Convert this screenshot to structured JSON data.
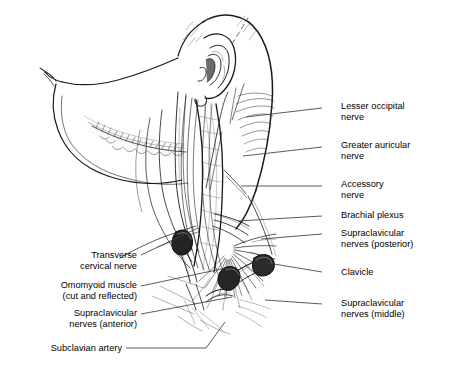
{
  "figure": {
    "background_color": "#ffffff",
    "ink_color": "#1a1a1a",
    "leader_color": "#3d3d3d",
    "labels_right": [
      {
        "id": "lesser-occipital-nerve",
        "lines": [
          "Lesser occipital",
          "nerve"
        ],
        "text_x": 341,
        "text_y": 101,
        "leader": {
          "x1": 322,
          "y1": 108,
          "x2": 246,
          "y2": 117
        }
      },
      {
        "id": "greater-auricular-nerve",
        "lines": [
          "Greater auricular",
          "nerve"
        ],
        "text_x": 341,
        "text_y": 140,
        "leader": {
          "x1": 322,
          "y1": 147,
          "x2": 243,
          "y2": 156
        }
      },
      {
        "id": "accessory-nerve",
        "lines": [
          "Accessory",
          "nerve"
        ],
        "text_x": 341,
        "text_y": 179,
        "leader": {
          "x1": 322,
          "y1": 186,
          "x2": 241,
          "y2": 186
        }
      },
      {
        "id": "brachial-plexus",
        "lines": [
          "Brachial plexus"
        ],
        "text_x": 341,
        "text_y": 212,
        "leader": {
          "x1": 322,
          "y1": 216,
          "x2": 238,
          "y2": 221
        }
      },
      {
        "id": "supraclavicular-nerves-posterior",
        "lines": [
          "Supraclavicular",
          "nerves (posterior)"
        ],
        "text_x": 341,
        "text_y": 229,
        "leader": {
          "x1": 322,
          "y1": 234,
          "x2": 261,
          "y2": 239
        }
      },
      {
        "id": "clavicle",
        "lines": [
          "Clavicle"
        ],
        "text_x": 341,
        "text_y": 270,
        "leader": {
          "x1": 322,
          "y1": 272,
          "x2": 268,
          "y2": 263
        }
      },
      {
        "id": "supraclavicular-nerves-middle",
        "lines": [
          "Supraclavicular",
          "nerves (middle)"
        ],
        "text_x": 341,
        "text_y": 299,
        "leader": {
          "x1": 322,
          "y1": 304,
          "x2": 265,
          "y2": 300
        }
      }
    ],
    "labels_left": [
      {
        "id": "transverse-cervical-nerve",
        "lines": [
          "Transverse",
          "cervical nerve"
        ],
        "text_right_x": 137,
        "text_y": 255,
        "leader": {
          "x1": 141,
          "y1": 255,
          "x2": 198,
          "y2": 228
        }
      },
      {
        "id": "omohyoid-muscle",
        "lines": [
          "Omomyoid muscle",
          "(cut and reflected)"
        ],
        "text_right_x": 137,
        "text_y": 283,
        "leader": {
          "x1": 141,
          "y1": 286,
          "x2": 226,
          "y2": 268
        }
      },
      {
        "id": "supraclavicular-nerves-anterior",
        "lines": [
          "Supraclavicular",
          "nerves (anterior)"
        ],
        "text_right_x": 137,
        "text_y": 311,
        "leader": {
          "x1": 141,
          "y1": 314,
          "x2": 232,
          "y2": 297
        }
      },
      {
        "id": "subclavian-artery",
        "lines": [
          "Subclavian artery"
        ],
        "text_right_x": 122,
        "text_y": 348,
        "leader_polyline": "126,348 206,348 225,322"
      }
    ]
  }
}
